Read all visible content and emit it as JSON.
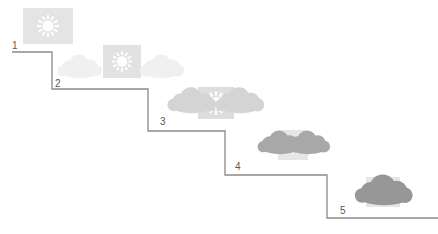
{
  "diagram": {
    "background_color": "#ffffff",
    "line_color": "#8a8a8c",
    "label_color": "#59595b",
    "steps": [
      {
        "label": "1",
        "label_x": 12,
        "label_y": 41,
        "tread_y": 52,
        "tread_x1": 12,
        "tread_x2": 52,
        "icon_name": "sun-clear-icon",
        "icon_x": 22,
        "icon_y": 7,
        "sky_state": "clear",
        "sun_visible": true,
        "cloud_count": 0,
        "cloud_color": "#e9e9ea",
        "sun_box_color": "#e4e4e4",
        "sun_glyph_color": "#ffffff"
      },
      {
        "label": "2",
        "label_x": 55,
        "label_y": 79,
        "tread_y": 89,
        "tread_x1": 52,
        "tread_x2": 148,
        "icon_name": "sun-with-light-clouds-icon",
        "icon_x": 58,
        "icon_y": 44,
        "sky_state": "mostly clear",
        "sun_visible": true,
        "cloud_count": 2,
        "cloud_color": "#f0f0f0",
        "sun_box_color": "#e2e2e2",
        "sun_glyph_color": "#ffffff"
      },
      {
        "label": "3",
        "label_x": 160,
        "label_y": 117,
        "tread_y": 131,
        "tread_x1": 148,
        "tread_x2": 225,
        "icon_name": "sun-with-medium-clouds-icon",
        "icon_x": 170,
        "icon_y": 85,
        "sky_state": "partly cloudy",
        "sun_visible": true,
        "cloud_count": 2,
        "cloud_color": "#d4d4d4",
        "sun_box_color": "#dedede",
        "sun_glyph_color": "#ffffff"
      },
      {
        "label": "4",
        "label_x": 235,
        "label_y": 162,
        "tread_y": 175,
        "tread_x1": 225,
        "tread_x2": 327,
        "icon_name": "mostly-cloudy-icon",
        "icon_x": 258,
        "icon_y": 129,
        "sky_state": "mostly cloudy",
        "sun_visible": false,
        "cloud_count": 2,
        "cloud_color": "#a8a8a8",
        "sun_box_color": "#e6e6e6",
        "sun_glyph_color": "#f2f2f2"
      },
      {
        "label": "5",
        "label_x": 340,
        "label_y": 206,
        "tread_y": 218,
        "tread_x1": 327,
        "tread_x2": 438,
        "icon_name": "overcast-icon",
        "icon_x": 350,
        "icon_y": 176,
        "sky_state": "overcast",
        "sun_visible": false,
        "cloud_count": 1,
        "cloud_color": "#979797",
        "sun_box_color": "#e6e6e6",
        "sun_glyph_color": "#f2f2f2"
      }
    ]
  }
}
